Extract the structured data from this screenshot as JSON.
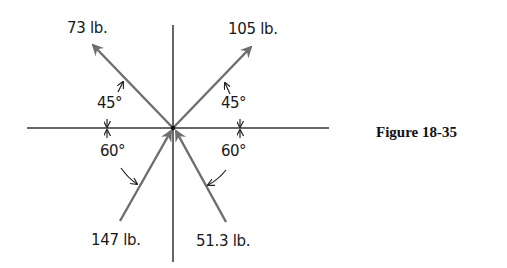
{
  "figure": {
    "caption": "Figure 18-35",
    "colors": {
      "axis": "#333333",
      "vector": "#6e6e6e",
      "text": "#1a1a1a"
    }
  },
  "forces": [
    {
      "name": "force-73",
      "label": "73 lb.",
      "direction": "outward",
      "angle_from_horizontal_deg": 45,
      "quadrant": "upper-left"
    },
    {
      "name": "force-105",
      "label": "105 lb.",
      "direction": "outward",
      "angle_from_horizontal_deg": 45,
      "quadrant": "upper-right"
    },
    {
      "name": "force-147",
      "label": "147 lb.",
      "direction": "inward",
      "angle_from_horizontal_deg": 60,
      "quadrant": "lower-left"
    },
    {
      "name": "force-51-3",
      "label": "51.3 lb.",
      "direction": "inward",
      "angle_from_horizontal_deg": 60,
      "quadrant": "lower-right"
    }
  ],
  "angles": {
    "upper_left": "45°",
    "upper_right": "45°",
    "lower_left": "60°",
    "lower_right": "60°"
  }
}
